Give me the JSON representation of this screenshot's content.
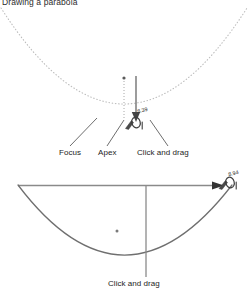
{
  "figure": {
    "title": "Drawing a parabola"
  },
  "upper_diagram": {
    "name": "parabola-construction-preview",
    "curve_style": "dotted",
    "curve_color": "#b9b9b9",
    "labels": [
      {
        "id": "focus",
        "text": "Focus"
      },
      {
        "id": "apex",
        "text": "Apex"
      },
      {
        "id": "click-and-drag",
        "text": "Click and drag"
      }
    ],
    "cursor": {
      "icon": "hand-drag-cursor",
      "tooltip": "8.39"
    },
    "drag_arrow": {
      "icon": "arrow-down-icon",
      "direction": "down"
    },
    "guide_line": {
      "style": "dotted",
      "orientation": "vertical"
    }
  },
  "lower_diagram": {
    "name": "parabola-result",
    "curve_style": "solid",
    "curve_color": "#6f6f6f",
    "labels": [
      {
        "id": "click-and-drag",
        "text": "Click and drag"
      }
    ],
    "cursor": {
      "icon": "hand-drag-cursor",
      "tooltip": "8.94"
    },
    "directrix_arrow": {
      "icon": "arrow-right-icon",
      "direction": "right"
    },
    "axis_line": {
      "orientation": "vertical"
    },
    "focus_point": {
      "icon": "focus-dot"
    }
  },
  "colors": {
    "ink": "#1d1d1d",
    "line_dark": "#6f6f6f",
    "line_light": "#b9b9b9"
  }
}
